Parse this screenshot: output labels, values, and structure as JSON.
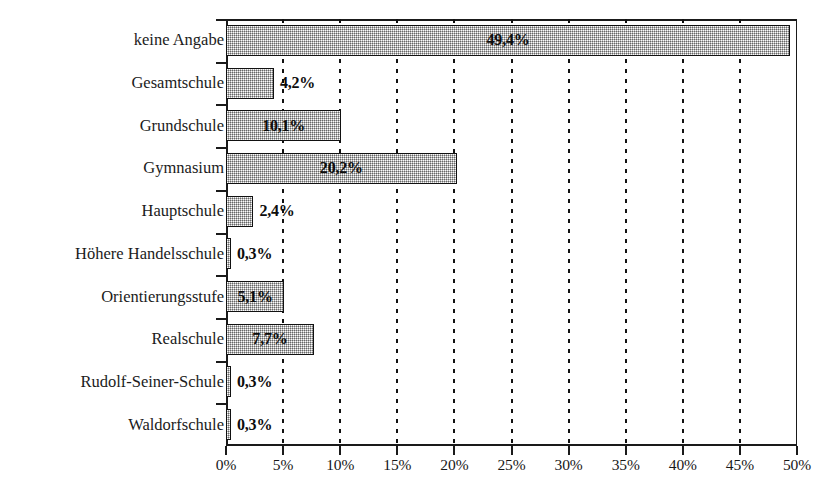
{
  "chart_data": {
    "type": "bar",
    "orientation": "horizontal",
    "title": "",
    "subtitle": "",
    "xlabel": "",
    "ylabel": "",
    "xlim": [
      0,
      50
    ],
    "xtick_step": 5,
    "grid": "vertical-dotted",
    "legend": "none",
    "value_suffix": "%",
    "decimal_separator": ",",
    "categories": [
      "keine Angabe",
      "Gesamtschule",
      "Grundschule",
      "Gymnasium",
      "Hauptschule",
      "Höhere Handelsschule",
      "Orientierungsstufe",
      "Realschule",
      "Rudolf-Seiner-Schule",
      "Waldorfschule"
    ],
    "values": [
      49.4,
      4.2,
      10.1,
      20.2,
      2.4,
      0.3,
      5.1,
      7.7,
      0.3,
      0.3
    ],
    "value_labels": [
      "49,4%",
      "4,2%",
      "10,1%",
      "20,2%",
      "2,4%",
      "0,3%",
      "5,1%",
      "7,7%",
      "0,3%",
      "0,3%"
    ],
    "label_placement": [
      "inside",
      "outside",
      "inside",
      "inside",
      "outside",
      "outside",
      "inside",
      "inside",
      "outside",
      "outside"
    ],
    "xtick_labels": [
      "0%",
      "5%",
      "10%",
      "15%",
      "20%",
      "25%",
      "30%",
      "35%",
      "40%",
      "45%",
      "50%"
    ],
    "xtick_values": [
      0,
      5,
      10,
      15,
      20,
      25,
      30,
      35,
      40,
      45,
      50
    ],
    "colors": {
      "bar_fill": "#b4b4b4",
      "bar_border": "#111111",
      "axis": "#1a1a1a",
      "gridline": "#111111",
      "text": "#1b1b1b",
      "background": "#ffffff"
    }
  }
}
